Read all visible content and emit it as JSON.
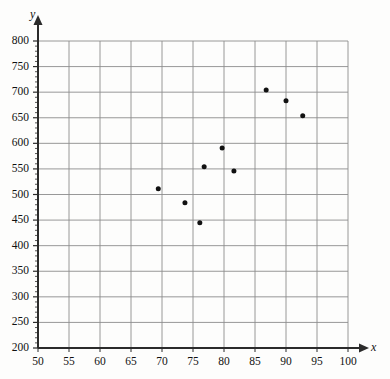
{
  "chart_data": {
    "type": "scatter",
    "title": "",
    "xlabel": "x",
    "ylabel": "y",
    "xlim": [
      50,
      100
    ],
    "ylim": [
      200,
      800
    ],
    "xticks": [
      50,
      55,
      60,
      65,
      70,
      75,
      80,
      85,
      90,
      95,
      100
    ],
    "yticks": [
      200,
      250,
      300,
      350,
      400,
      450,
      500,
      550,
      600,
      650,
      700,
      750,
      800
    ],
    "grid": true,
    "legend": "none",
    "minor_ticks_axis": "y",
    "marker": {
      "shape": "circle",
      "color": "#111111",
      "size_px": 5
    },
    "points": [
      {
        "x": 69.4,
        "y": 511
      },
      {
        "x": 73.7,
        "y": 484
      },
      {
        "x": 76.1,
        "y": 445
      },
      {
        "x": 76.8,
        "y": 554
      },
      {
        "x": 79.7,
        "y": 591
      },
      {
        "x": 81.6,
        "y": 546
      },
      {
        "x": 86.8,
        "y": 704
      },
      {
        "x": 90.0,
        "y": 683
      },
      {
        "x": 92.7,
        "y": 654
      }
    ]
  },
  "colors": {
    "axis": "#2b2b2b",
    "grid": "#8c8c8c",
    "marker": "#111111",
    "background": "#fdfdfc",
    "text": "#111111"
  },
  "geometry": {
    "left_px": 38,
    "right_px": 348,
    "top_px": 41,
    "bottom_px": 348
  }
}
